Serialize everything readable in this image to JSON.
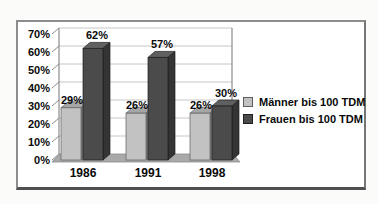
{
  "window": {
    "background": "#fbfbf9"
  },
  "frame": {
    "background": "#ffffff",
    "border_color": "#8d8d8d",
    "border_bottom_color": "#4f4f4f"
  },
  "chart_data": {
    "type": "bar",
    "style": "3d-column",
    "title": "",
    "categories": [
      "1986",
      "1991",
      "1998"
    ],
    "series": [
      {
        "name": "Männer bis 100 TDM",
        "values": [
          29,
          26,
          26
        ],
        "color": "#c2c2c2",
        "color_top": "#a6a6a6",
        "color_side": "#7f7f7f",
        "color_edge": "#5e5e5e"
      },
      {
        "name": "Frauen bis 100 TDM",
        "values": [
          62,
          57,
          30
        ],
        "color": "#4b4b4b",
        "color_top": "#606060",
        "color_side": "#343434",
        "color_edge": "#1f1f1f"
      }
    ],
    "data_labels": [
      [
        "29%",
        "26%",
        "26%"
      ],
      [
        "62%",
        "57%",
        "30%"
      ]
    ],
    "value_suffix": "%",
    "ylim": [
      0,
      70
    ],
    "ytick_step": 10,
    "ytick_labels": [
      "0%",
      "10%",
      "20%",
      "30%",
      "40%",
      "50%",
      "60%",
      "70%"
    ],
    "grid": true,
    "legend_position": "right",
    "plot": {
      "gridline_color": "#c6c6c6",
      "wall_edge_color": "#8c8c8c",
      "floor_color": "#a9a9a9",
      "text_color": "#0a0a0a"
    }
  }
}
